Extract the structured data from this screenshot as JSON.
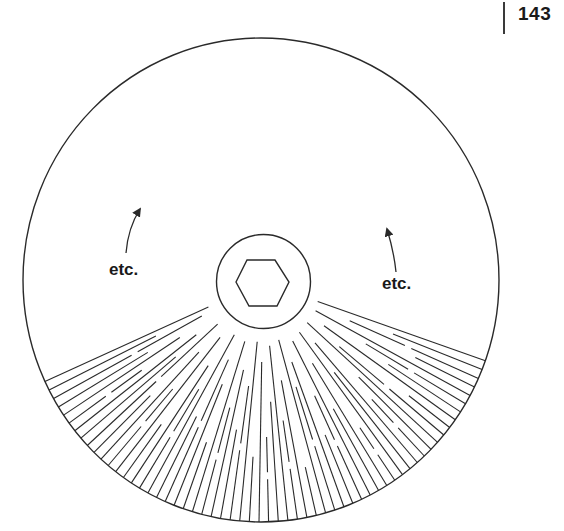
{
  "page": {
    "number": "143"
  },
  "figure": {
    "labels": {
      "left": "etc.",
      "right": "etc."
    },
    "colors": {
      "stroke": "#2a2a2a",
      "background": "#ffffff"
    },
    "outer_circle": {
      "cx": 261,
      "cy": 280,
      "rx": 238,
      "ry": 242
    },
    "inner_circle": {
      "cx": 263.5,
      "cy": 281.5,
      "r": 47
    },
    "hexagon": {
      "points": [
        [
          236,
          282
        ],
        [
          247,
          260
        ],
        [
          275,
          260
        ],
        [
          289,
          282
        ],
        [
          277,
          306
        ],
        [
          249,
          306
        ]
      ]
    },
    "arrows": [
      {
        "name": "left-arrow",
        "path": "M126,253 Q128,228 140,209",
        "tip": [
          140,
          209
        ]
      },
      {
        "name": "right-arrow",
        "path": "M396,272 Q394,252 387,229",
        "tip": [
          387,
          229
        ]
      }
    ],
    "rays": {
      "center": [
        263,
        282
      ],
      "angle_start_deg": 19.5,
      "angle_end_deg": 155.5,
      "count": 60,
      "start_radius_pattern": [
        58,
        140,
        95,
        170,
        60,
        120,
        150,
        75,
        185,
        100,
        60,
        135,
        160,
        80,
        115,
        62,
        175,
        95,
        145,
        66,
        125,
        165,
        85,
        110,
        60,
        190,
        100,
        140,
        64,
        120,
        155,
        80,
        175,
        60,
        105,
        150,
        90,
        130,
        62,
        170,
        110,
        85,
        150,
        60,
        125,
        100,
        175,
        70,
        140,
        95,
        160,
        62,
        115,
        85,
        150,
        100,
        135,
        70,
        120,
        60
      ],
      "gap_pattern": [
        0,
        0,
        1,
        0,
        0,
        1,
        0,
        0,
        0,
        1,
        0,
        0,
        1,
        0,
        0,
        0,
        1,
        0,
        0,
        0,
        1,
        0,
        0,
        1,
        0,
        0,
        0,
        1,
        0,
        0,
        1,
        0,
        0,
        0,
        1,
        0,
        0,
        1,
        0,
        0,
        0,
        1,
        0,
        0,
        1,
        0,
        0,
        0,
        1,
        0,
        0,
        1,
        0,
        0,
        1,
        0,
        0,
        1,
        0,
        0
      ]
    }
  }
}
